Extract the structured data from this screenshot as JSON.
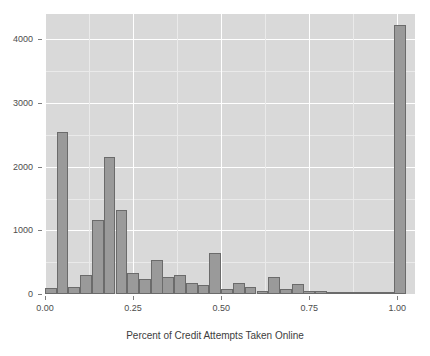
{
  "chart_data": {
    "type": "bar",
    "title": "",
    "subtitle": "",
    "xlabel": "Percent of Credit Attempts Taken Online",
    "ylabel": "",
    "xlim": [
      0.0,
      1.05
    ],
    "ylim": [
      0,
      4400
    ],
    "grid": true,
    "legend": null,
    "bin_width": 0.0333,
    "xticks": [
      {
        "value": 0.0,
        "label": "0.00"
      },
      {
        "value": 0.25,
        "label": "0.25"
      },
      {
        "value": 0.5,
        "label": "0.50"
      },
      {
        "value": 0.75,
        "label": "0.75"
      },
      {
        "value": 1.0,
        "label": "1.00"
      }
    ],
    "yticks": [
      {
        "value": 0,
        "label": "0"
      },
      {
        "value": 1000,
        "label": "1000"
      },
      {
        "value": 2000,
        "label": "2000"
      },
      {
        "value": 3000,
        "label": "3000"
      },
      {
        "value": 4000,
        "label": "4000"
      }
    ],
    "bin_centers": [
      0.017,
      0.05,
      0.083,
      0.117,
      0.15,
      0.183,
      0.217,
      0.25,
      0.283,
      0.317,
      0.35,
      0.383,
      0.417,
      0.45,
      0.483,
      0.517,
      0.55,
      0.583,
      0.617,
      0.65,
      0.683,
      0.717,
      0.75,
      0.783,
      0.817,
      0.85,
      0.883,
      0.917,
      0.95,
      0.983,
      1.008
    ],
    "values": [
      95,
      2550,
      115,
      300,
      1165,
      2155,
      1320,
      330,
      230,
      535,
      260,
      300,
      180,
      145,
      645,
      85,
      175,
      110,
      50,
      265,
      75,
      155,
      50,
      45,
      35,
      12,
      10,
      8,
      8,
      20,
      4225
    ],
    "bar_fill_color": "#9a9a9a",
    "bar_border_color": "#6b6b6b",
    "panel_background": "#d9d9d9",
    "gridline_color": "#ffffff",
    "plot_background": "#ffffff"
  }
}
